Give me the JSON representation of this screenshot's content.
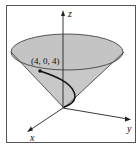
{
  "figure": {
    "type": "3d-cone-diagram",
    "axes": {
      "x": "x",
      "y": "y",
      "z": "z"
    },
    "point_label": "(4, 0, 4)",
    "colors": {
      "cone_fill": "#c8c8c8",
      "frame": "#555555",
      "curve": "#111111"
    }
  }
}
